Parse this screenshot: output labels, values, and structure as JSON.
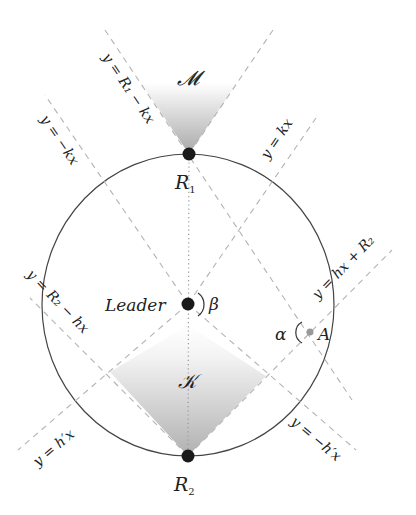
{
  "diagram": {
    "type": "geometric-construction",
    "circle": {
      "cx": 188,
      "cy": 305,
      "rx": 146,
      "ry": 151,
      "stroke": "#444444"
    },
    "points": {
      "R1": {
        "label": "R",
        "sub": "1",
        "x": 189,
        "y": 154
      },
      "R2": {
        "label": "R",
        "sub": "2",
        "x": 188,
        "y": 456
      },
      "leader": {
        "label": "Leader",
        "x": 188,
        "y": 304
      },
      "A": {
        "label": "A",
        "x": 310,
        "y": 332,
        "color": "#999999"
      }
    },
    "angles": {
      "beta": {
        "label": "β"
      },
      "alpha": {
        "label": "α"
      }
    },
    "regions": {
      "M": {
        "label": "𝓜"
      },
      "K": {
        "label": "𝒦"
      }
    },
    "lines": {
      "r1_minus_kx": {
        "eq": "y = R₁ − kx"
      },
      "kx": {
        "eq": "y = kx"
      },
      "minus_kx": {
        "eq": "y = −kx"
      },
      "hx_plus_r2": {
        "eq": "y = hx + R₂"
      },
      "r2_minus_hx": {
        "eq": "y = R₂ − hx"
      },
      "hpx": {
        "eq": "y = h′x"
      },
      "minus_hpx": {
        "eq": "y = −h′x"
      }
    },
    "colors": {
      "dashed": "#b3b3b3",
      "circle": "#444444",
      "point": "#1a1a1a",
      "shade_dark": "#a8a8a8",
      "shade_light": "#ffffff"
    }
  }
}
